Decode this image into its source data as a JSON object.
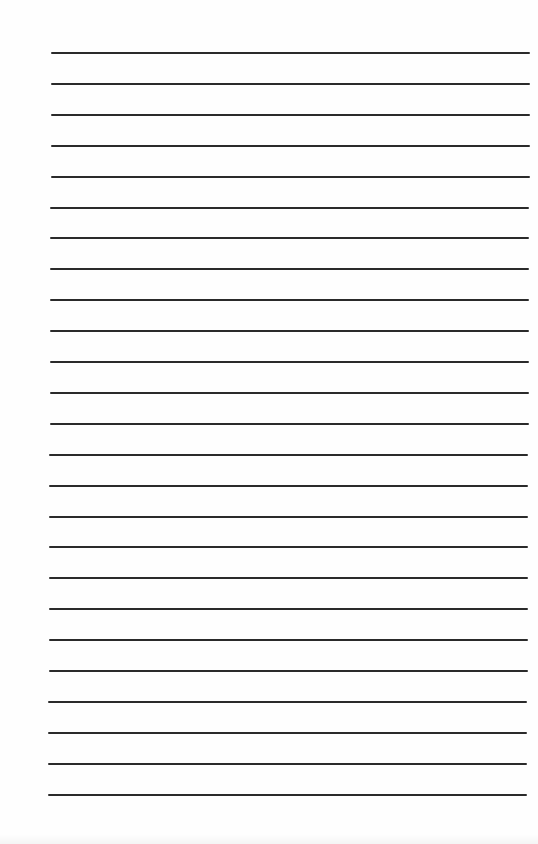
{
  "document": {
    "type": "lined-paper",
    "background_color": "#fefefe",
    "line_color": "#2a2a2a",
    "line_count": 25,
    "first_line_y": 53,
    "line_spacing": 30.9,
    "line_start_x_top": 51,
    "line_end_x_top": 530,
    "line_start_x_bottom": 48,
    "line_end_x_bottom": 527
  }
}
